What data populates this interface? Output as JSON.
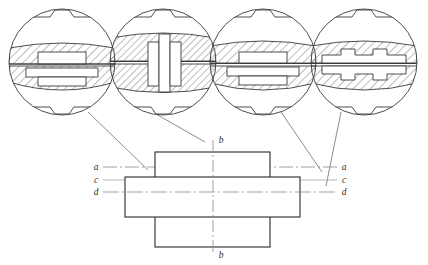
{
  "drawing": {
    "title_fragment": "",
    "kind": "engineering-section-drawing",
    "line_color": "#3a3a3a",
    "hatch_color": "#555555",
    "center_line_color": "#8a8a8a",
    "leader_color": "#5a5a5a",
    "background": "#ffffff"
  },
  "detail_views": [
    {
      "id": "detail-a",
      "label": "",
      "description": "circular section view, upper shallow hatched segment with rectangular key, lower hatched segment with wide flat key",
      "cx": 62,
      "cy": 62,
      "r": 53
    },
    {
      "id": "detail-b",
      "label": "",
      "description": "circular section view, fully hatched both halves with vertical cross-shaped key spanning the split line",
      "cx": 163,
      "cy": 62,
      "r": 53
    },
    {
      "id": "detail-c",
      "label": "",
      "description": "circular section view, upper hatched lens with raised rectangular key, lower hatched lens with wide key",
      "cx": 263,
      "cy": 62,
      "r": 53
    },
    {
      "id": "detail-d",
      "label": "",
      "description": "circular section view with stepped double-tab key profiles top and bottom",
      "cx": 364,
      "cy": 62,
      "r": 53
    }
  ],
  "main_view": {
    "vertical_block": {
      "x": 155,
      "y": 152,
      "w": 115,
      "h": 95
    },
    "horizontal_block": {
      "x": 125,
      "y": 177,
      "w": 175,
      "h": 40
    },
    "section_lines": [
      {
        "name": "a",
        "y": 167,
        "left_label": "a",
        "right_label": "a",
        "style": "dash-dot"
      },
      {
        "name": "c",
        "y": 180,
        "left_label": "c",
        "right_label": "c",
        "style": "thin"
      },
      {
        "name": "d",
        "y": 192,
        "left_label": "d",
        "right_label": "d",
        "style": "dash-dot"
      }
    ],
    "vertical_section_line": {
      "name": "b",
      "x": 213,
      "top_label": "b",
      "bottom_label": "b",
      "style": "dash-dot"
    }
  },
  "labels": {
    "a_left": "a",
    "a_right": "a",
    "b_top": "b",
    "b_bottom": "b",
    "c_left": "c",
    "c_right": "c",
    "d_left": "d",
    "d_right": "d"
  },
  "leaders": [
    {
      "from_detail": "detail-a",
      "x1": 88,
      "y1": 112,
      "x2": 148,
      "y2": 170
    },
    {
      "from_detail": "detail-b",
      "x1": 156,
      "y1": 114,
      "x2": 205,
      "y2": 142
    },
    {
      "from_detail": "detail-c",
      "x1": 281,
      "y1": 112,
      "x2": 322,
      "y2": 172
    },
    {
      "from_detail": "detail-d",
      "x1": 341,
      "y1": 112,
      "x2": 326,
      "y2": 186
    }
  ]
}
